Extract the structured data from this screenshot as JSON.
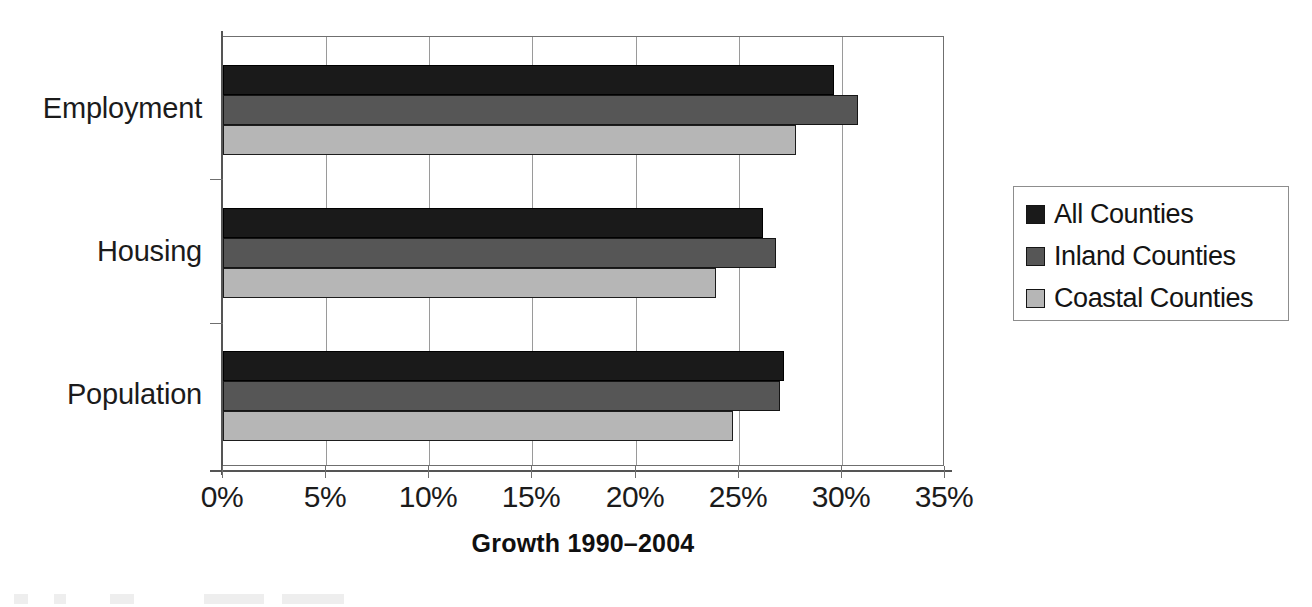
{
  "chart_data": {
    "type": "bar",
    "orientation": "horizontal",
    "title": "",
    "xlabel": "Growth 1990–2004",
    "ylabel": "",
    "categories": [
      "Employment",
      "Housing",
      "Population"
    ],
    "series": [
      {
        "name": "All Counties",
        "color": "#1a1a1a",
        "values": [
          29.6,
          26.2,
          27.2
        ]
      },
      {
        "name": "Inland Counties",
        "color": "#565656",
        "values": [
          30.8,
          26.8,
          27.0
        ]
      },
      {
        "name": "Coastal Counties",
        "color": "#b6b6b6",
        "values": [
          27.8,
          23.9,
          24.7
        ]
      }
    ],
    "xlim": [
      0,
      35
    ],
    "xticks": [
      0,
      5,
      10,
      15,
      20,
      25,
      30,
      35
    ],
    "xtick_labels": [
      "0%",
      "5%",
      "10%",
      "15%",
      "20%",
      "25%",
      "30%",
      "35%"
    ],
    "grid": "vertical",
    "legend_position": "right",
    "value_unit": "percent"
  },
  "legend": {
    "items": [
      {
        "label": "All Counties"
      },
      {
        "label": "Inland Counties"
      },
      {
        "label": "Coastal Counties"
      }
    ]
  },
  "axis": {
    "x_title": "Growth 1990–2004"
  }
}
